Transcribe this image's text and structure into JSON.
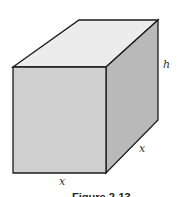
{
  "diagram": {
    "type": "rectangular box (square base)",
    "labels": {
      "height": "h",
      "depth": "x",
      "width": "x"
    },
    "caption": "Figure 2-13",
    "colors": {
      "top_face": "#ececec",
      "front_face": "#cfcfcf",
      "side_face": "#b9b9b9",
      "edge": "#1a1a1a"
    }
  }
}
